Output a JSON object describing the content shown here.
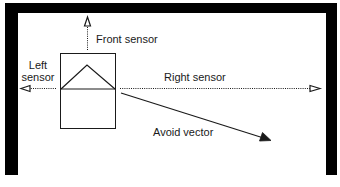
{
  "diagram": {
    "title": "",
    "colors": {
      "background": "#ffffff",
      "wall": "#000000",
      "stroke": "#1a1a1a"
    },
    "walls": [
      {
        "name": "top-wall",
        "x": 5,
        "y": 3,
        "w": 332,
        "h": 10
      },
      {
        "name": "left-wall",
        "x": 5,
        "y": 3,
        "w": 13,
        "h": 172
      },
      {
        "name": "right-wall",
        "x": 326,
        "y": 3,
        "w": 11,
        "h": 172
      }
    ],
    "robot": {
      "body": {
        "x": 60,
        "y": 53,
        "w": 55,
        "h": 75
      },
      "heading_triangle": {
        "apex": [
          87,
          65
        ],
        "base_left": [
          61,
          89
        ],
        "base_right": [
          115,
          89
        ]
      }
    },
    "sensors": {
      "front": {
        "label": "Front sensor",
        "from": [
          87,
          50
        ],
        "to": [
          87,
          17
        ]
      },
      "left": {
        "label_line1": "Left",
        "label_line2": "sensor",
        "from": [
          56,
          88
        ],
        "to": [
          22,
          88
        ]
      },
      "right": {
        "label": "Right sensor",
        "from": [
          120,
          88
        ],
        "to": [
          320,
          88
        ]
      }
    },
    "avoid_vector": {
      "label": "Avoid vector",
      "from": [
        121,
        93
      ],
      "to": [
        270,
        140
      ]
    }
  }
}
